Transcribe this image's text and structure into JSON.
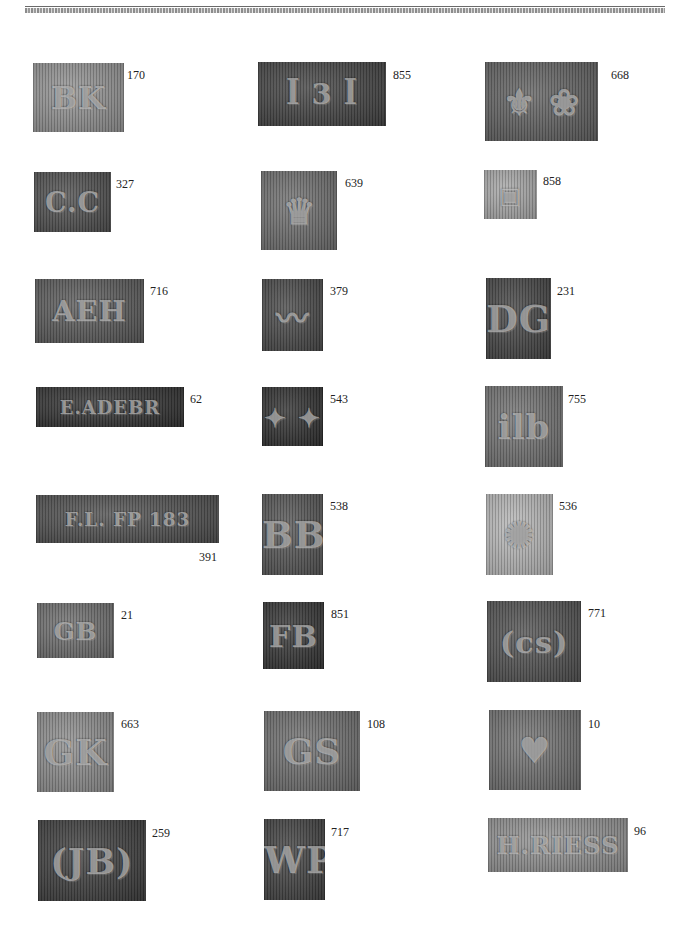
{
  "page": {
    "header_text_cropped": "",
    "background": "#ffffff"
  },
  "hallmarks": [
    {
      "number": "170",
      "glyph": "BK",
      "tone": "#8f8f8f",
      "x": 33,
      "y": 63,
      "w": 91,
      "h": 69,
      "nx": 127,
      "ny": 69
    },
    {
      "number": "855",
      "glyph": "ꟾ 3 ꟾ",
      "tone": "#3e3e3e",
      "x": 258,
      "y": 62,
      "w": 128,
      "h": 64,
      "nx": 393,
      "ny": 69
    },
    {
      "number": "668",
      "glyph": "⚜ ❀",
      "tone": "#5c5c5c",
      "x": 485,
      "y": 62,
      "w": 113,
      "h": 79,
      "nx": 611,
      "ny": 69
    },
    {
      "number": "327",
      "glyph": "C.C",
      "tone": "#4a4a4a",
      "x": 34,
      "y": 172,
      "w": 77,
      "h": 60,
      "nx": 116,
      "ny": 178
    },
    {
      "number": "639",
      "glyph": "♛",
      "tone": "#6a6a6a",
      "x": 261,
      "y": 171,
      "w": 76,
      "h": 79,
      "nx": 345,
      "ny": 177
    },
    {
      "number": "858",
      "glyph": "▣",
      "tone": "#a5a5a5",
      "x": 484,
      "y": 170,
      "w": 53,
      "h": 49,
      "nx": 543,
      "ny": 175
    },
    {
      "number": "716",
      "glyph": "AEH",
      "tone": "#555555",
      "x": 35,
      "y": 279,
      "w": 109,
      "h": 64,
      "nx": 150,
      "ny": 285
    },
    {
      "number": "379",
      "glyph": "〰",
      "tone": "#434343",
      "x": 262,
      "y": 279,
      "w": 61,
      "h": 72,
      "nx": 330,
      "ny": 285
    },
    {
      "number": "231",
      "glyph": "DG",
      "tone": "#3f3f3f",
      "x": 486,
      "y": 278,
      "w": 65,
      "h": 81,
      "nx": 557,
      "ny": 285
    },
    {
      "number": "62",
      "glyph": "E.ADEBR",
      "tone": "#2c2c2c",
      "x": 36,
      "y": 387,
      "w": 148,
      "h": 40,
      "nx": 190,
      "ny": 393
    },
    {
      "number": "543",
      "glyph": "✦ ✦",
      "tone": "#2a2a2a",
      "x": 262,
      "y": 387,
      "w": 61,
      "h": 59,
      "nx": 330,
      "ny": 393
    },
    {
      "number": "755",
      "glyph": "ilb",
      "tone": "#6e6e6e",
      "x": 485,
      "y": 386,
      "w": 78,
      "h": 81,
      "nx": 568,
      "ny": 393
    },
    {
      "number": "391",
      "glyph": "F.L.  FP  183",
      "tone": "#4a4a4a",
      "x": 36,
      "y": 495,
      "w": 183,
      "h": 48,
      "nx": 199,
      "ny": 551
    },
    {
      "number": "538",
      "glyph": "BB",
      "tone": "#505050",
      "x": 262,
      "y": 494,
      "w": 61,
      "h": 81,
      "nx": 330,
      "ny": 500
    },
    {
      "number": "536",
      "glyph": "✺",
      "tone": "#b5b5b5",
      "x": 486,
      "y": 494,
      "w": 67,
      "h": 81,
      "nx": 559,
      "ny": 500
    },
    {
      "number": "21",
      "glyph": "GB",
      "tone": "#6a6a6a",
      "x": 37,
      "y": 603,
      "w": 77,
      "h": 55,
      "nx": 121,
      "ny": 609
    },
    {
      "number": "851",
      "glyph": "FB",
      "tone": "#2f2f2f",
      "x": 263,
      "y": 602,
      "w": 61,
      "h": 67,
      "nx": 331,
      "ny": 608
    },
    {
      "number": "771",
      "glyph": "(cs)",
      "tone": "#4c4c4c",
      "x": 487,
      "y": 601,
      "w": 94,
      "h": 81,
      "nx": 588,
      "ny": 607
    },
    {
      "number": "663",
      "glyph": "GK",
      "tone": "#8a8a8a",
      "x": 37,
      "y": 712,
      "w": 77,
      "h": 80,
      "nx": 121,
      "ny": 718
    },
    {
      "number": "108",
      "glyph": "GS",
      "tone": "#6a6a6a",
      "x": 264,
      "y": 711,
      "w": 96,
      "h": 80,
      "nx": 367,
      "ny": 718
    },
    {
      "number": "10",
      "glyph": "♥",
      "tone": "#6c6c6c",
      "x": 489,
      "y": 710,
      "w": 92,
      "h": 80,
      "nx": 588,
      "ny": 718
    },
    {
      "number": "259",
      "glyph": "(JB)",
      "tone": "#383838",
      "x": 38,
      "y": 820,
      "w": 108,
      "h": 81,
      "nx": 152,
      "ny": 827
    },
    {
      "number": "717",
      "glyph": "WP",
      "tone": "#3c3c3c",
      "x": 264,
      "y": 819,
      "w": 61,
      "h": 81,
      "nx": 331,
      "ny": 826
    },
    {
      "number": "96",
      "glyph": "H.RIESS",
      "tone": "#8e8e8e",
      "x": 488,
      "y": 818,
      "w": 140,
      "h": 54,
      "nx": 634,
      "ny": 825
    }
  ]
}
